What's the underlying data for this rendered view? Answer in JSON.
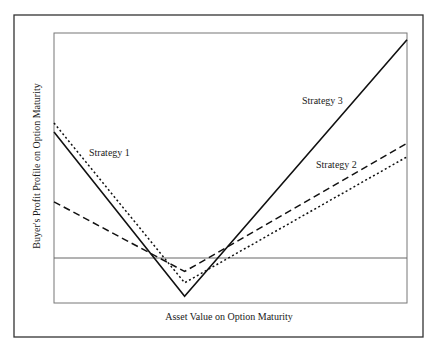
{
  "chart_data": {
    "type": "line",
    "title": "",
    "xlabel": "Asset Value on Option Maturity",
    "ylabel": "Buyer's Profit Profile on Option Maturity",
    "grid": false,
    "legend": "inline labels",
    "x": [
      0,
      0.37,
      1.0
    ],
    "x_note": "Axes unlabeled (no ticks). x normalized: 0 = left edge, 0.37 = common strike/vertex, 1 = right edge. y normalized so 0 = horizontal zero-profit line, 1 = plot top height above zero line.",
    "zero_line_y": 0,
    "ylim": [
      -0.2,
      1.0
    ],
    "series": [
      {
        "name": "Strategy 3",
        "style": "solid",
        "values": [
          0.56,
          -0.17,
          0.97
        ]
      },
      {
        "name": "Strategy 1",
        "style": "dotted",
        "values": [
          0.6,
          -0.11,
          0.45
        ]
      },
      {
        "name": "Strategy 2",
        "style": "dashed",
        "values": [
          0.25,
          -0.06,
          0.51
        ]
      }
    ],
    "annotations": [
      {
        "text": "Strategy 1",
        "near": "left descending lines"
      },
      {
        "text": "Strategy 2",
        "near": "right dashed/dotted lines"
      },
      {
        "text": "Strategy 3",
        "near": "right steep solid line"
      }
    ]
  },
  "labels": {
    "xlabel": "Asset Value on Option Maturity",
    "ylabel": "Buyer's Profit Profile on Option Maturity",
    "strategy1": "Strategy 1",
    "strategy2": "Strategy 2",
    "strategy3": "Strategy 3"
  },
  "pixel_geometry": {
    "plot": {
      "left": 54,
      "top": 33,
      "right": 407,
      "bottom": 303
    },
    "zero_y": 258,
    "vertex_x": 185,
    "solid": "54,132 185,297 407,39",
    "dotted": "54,122 185,284 407,157",
    "dashed": "54,201 185,272 407,143"
  }
}
